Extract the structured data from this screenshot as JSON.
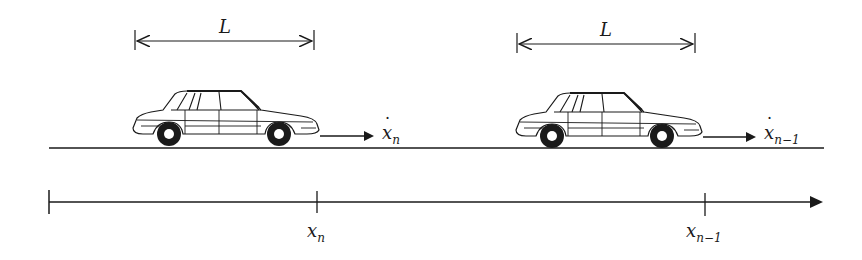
{
  "figure": {
    "colors": {
      "stroke": "#1a1a1a",
      "background": "#ffffff"
    },
    "car_follower": {
      "length_label": "L",
      "velocity_var": "x",
      "velocity_sub": "n",
      "position_var": "x",
      "position_sub": "n"
    },
    "car_leader": {
      "length_label": "L",
      "velocity_var": "x",
      "velocity_sub": "n−1",
      "position_var": "x",
      "position_sub": "n−1"
    },
    "road": {
      "present": true
    },
    "axis": {
      "direction": "right",
      "ticks": [
        "origin",
        "x_n",
        "x_{n-1}"
      ]
    }
  }
}
